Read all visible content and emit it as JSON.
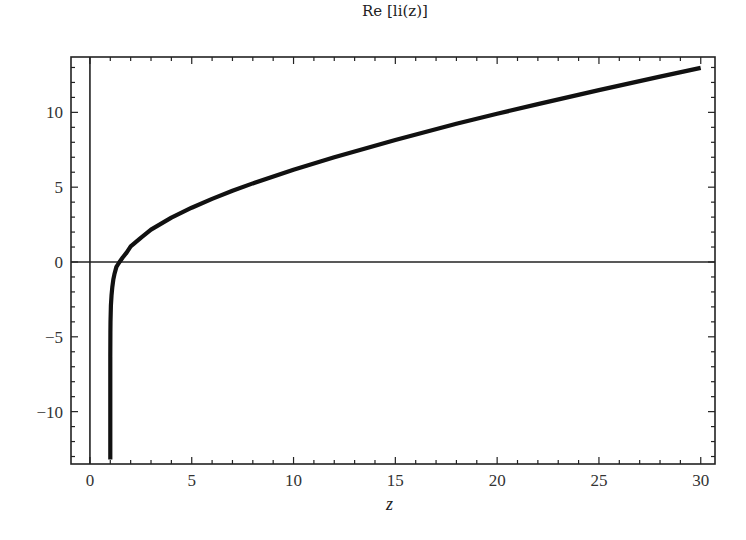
{
  "chart_data": {
    "type": "line",
    "title": "Re [li(z)]",
    "xlabel": "z",
    "ylabel": "",
    "xlim": [
      -0.93,
      30.7
    ],
    "ylim": [
      -13.5,
      13.7
    ],
    "grid": false,
    "legend": null,
    "x_ticks": [
      0,
      5,
      10,
      15,
      20,
      25,
      30
    ],
    "x_tick_labels": [
      "0",
      "5",
      "10",
      "15",
      "20",
      "25",
      "30"
    ],
    "y_ticks": [
      -10,
      -5,
      0,
      5,
      10
    ],
    "y_tick_labels": [
      "−10",
      "−5",
      "0",
      "5",
      "10"
    ],
    "axes_lines": {
      "x_axis_at_y": 0,
      "y_axis_at_x": 0
    },
    "series": [
      {
        "name": "Re[li(z)]",
        "color": "#111111",
        "x": [
          1.0,
          1.001,
          1.005,
          1.01,
          1.03,
          1.06,
          1.1,
          1.15,
          1.2,
          1.3,
          1.45,
          1.6,
          1.8,
          2.0,
          2.5,
          3.0,
          4.0,
          5.0,
          6.0,
          7.0,
          8.0,
          10.0,
          12.0,
          15.0,
          18.0,
          20.0,
          22.0,
          25.0,
          28.0,
          30.0
        ],
        "values": [
          -13.2,
          -6.33,
          -4.72,
          -4.02,
          -2.92,
          -2.26,
          -1.68,
          -1.18,
          -0.82,
          -0.33,
          0.0,
          0.28,
          0.63,
          1.045,
          1.62,
          2.163,
          2.97,
          3.63,
          4.22,
          4.76,
          5.25,
          6.166,
          7.0,
          8.16,
          9.24,
          9.905,
          10.55,
          11.49,
          12.39,
          12.97
        ]
      }
    ]
  },
  "colors": {
    "line": "#111111",
    "frame": "#222222",
    "background": "#ffffff"
  }
}
